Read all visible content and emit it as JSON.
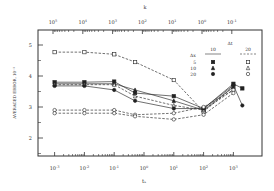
{
  "chart_data": {
    "type": "line",
    "title": "",
    "xlabel": "t_s",
    "x2label": "k",
    "ylabel": "AVERAGED ERROR, 10^-3",
    "xscale": "log",
    "xlim_log10": [
      -3.5,
      4.0
    ],
    "ylim": [
      1.6,
      5.5
    ],
    "grid": false,
    "x_ticks": [
      "10^-3",
      "10^-2",
      "10^-1",
      "10^0",
      "10^1",
      "10^2",
      "10^3"
    ],
    "x2_ticks": [
      "10^5",
      "10^4",
      "10^3",
      "10^2",
      "10^1",
      "10^0",
      "10^-1"
    ],
    "y_ticks": [
      "2",
      "3",
      "4",
      "5"
    ],
    "legend": {
      "position": "upper right",
      "header_left": "Δx",
      "header_right": "Δt",
      "columns": [
        "10",
        "20"
      ],
      "rows": [
        "5",
        "10",
        "20"
      ],
      "markers_10": [
        "filled-square",
        "filled-triangle",
        "filled-circle"
      ],
      "markers_20": [
        "open-square",
        "open-triangle",
        "open-circle"
      ]
    },
    "x": [
      -3,
      -2,
      -1,
      -0.3,
      1,
      2,
      3,
      3.3
    ],
    "series": [
      {
        "name": "Δx=5, Δt=20",
        "marker": "open-square",
        "style": "dashed",
        "values": [
          4.77,
          4.77,
          4.7,
          4.45,
          3.87,
          2.85,
          3.65,
          null
        ]
      },
      {
        "name": "Δx=5, Δt=10",
        "marker": "filled-square",
        "style": "solid",
        "values": [
          3.8,
          3.8,
          3.82,
          3.45,
          3.35,
          2.95,
          3.75,
          3.6
        ]
      },
      {
        "name": "Δx=10, Δt=10",
        "marker": "filled-triangle",
        "style": "solid",
        "values": [
          3.75,
          3.75,
          3.75,
          3.55,
          3.2,
          2.9,
          3.65,
          null
        ]
      },
      {
        "name": "Δx=10, Δt=20",
        "marker": "open-triangle",
        "style": "dashed",
        "values": [
          3.72,
          3.72,
          3.72,
          3.35,
          3.05,
          2.9,
          3.55,
          null
        ]
      },
      {
        "name": "Δx=20, Δt=10",
        "marker": "filled-circle",
        "style": "solid",
        "values": [
          3.68,
          3.68,
          3.55,
          3.2,
          2.95,
          2.95,
          3.7,
          3.05
        ]
      },
      {
        "name": "Δx=20, Δt=20",
        "marker": "open-circle",
        "style": "dashed",
        "values": [
          2.9,
          2.9,
          2.9,
          2.75,
          2.8,
          3.0,
          3.55,
          null
        ]
      },
      {
        "name": "Δx=20, Δt=20 (lower)",
        "marker": "open-circle",
        "style": "dashed",
        "values": [
          2.8,
          2.8,
          2.8,
          2.7,
          2.6,
          2.75,
          3.45,
          null
        ]
      }
    ]
  }
}
